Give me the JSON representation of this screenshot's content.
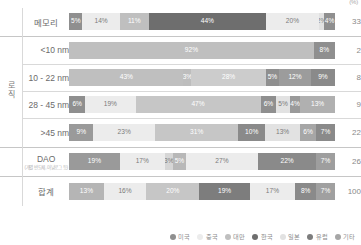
{
  "unit_label": "(%)",
  "legend": {
    "position": "bottom-right",
    "entries": [
      {
        "label": "미국",
        "color": "#8f8f8f"
      },
      {
        "label": "중국",
        "color": "#ececec"
      },
      {
        "label": "대만",
        "color": "#bfbfbf"
      },
      {
        "label": "한국",
        "color": "#6e6e6e"
      },
      {
        "label": "일본",
        "color": "#e2e2e2"
      },
      {
        "label": "유럽",
        "color": "#7d7d7d"
      },
      {
        "label": "기타",
        "color": "#a6a6a6"
      }
    ]
  },
  "groups": [
    {
      "name": "memory",
      "label": "",
      "rows": [
        "memory"
      ]
    },
    {
      "name": "logic",
      "label": "로직",
      "rows": [
        "lt10",
        "n10_22",
        "n28_45",
        "gt45"
      ]
    },
    {
      "name": "dao",
      "label": "",
      "rows": [
        "dao"
      ]
    },
    {
      "name": "total",
      "label": "",
      "rows": [
        "sum"
      ]
    }
  ],
  "row_labels": {
    "memory": {
      "main": "메모리",
      "sub": ""
    },
    "lt10": {
      "main": "<10 nm",
      "sub": ""
    },
    "n10_22": {
      "main": "10 - 22 nm",
      "sub": ""
    },
    "n28_45": {
      "main": "28 - 45 nm",
      "sub": ""
    },
    "gt45": {
      "main": ">45 nm",
      "sub": ""
    },
    "dao": {
      "main": "DAO",
      "sub": "(개별 반도체, 아날로그 등)"
    },
    "sum": {
      "main": "합계",
      "sub": ""
    }
  },
  "totals": {
    "memory": "33",
    "lt10": "2",
    "n10_22": "8",
    "n28_45": "9",
    "gt45": "22",
    "dao": "26",
    "sum": "100"
  },
  "chart_data": {
    "type": "bar",
    "orientation": "horizontal",
    "stacked": true,
    "stack_mode": "100%",
    "title": "",
    "xlabel": "",
    "ylabel": "",
    "xlim": [
      0,
      100
    ],
    "grid": false,
    "unit": "(%)",
    "categories": [
      "메모리",
      "<10 nm",
      "10 - 22 nm",
      "28 - 45 nm",
      ">45 nm",
      "DAO",
      "합계"
    ],
    "category_groups": [
      "",
      "로직",
      "로직",
      "로직",
      "로직",
      "",
      ""
    ],
    "series": [
      {
        "name": "미국",
        "color": "#8f8f8f",
        "values": [
          5,
          0,
          0,
          6,
          9,
          19,
          13
        ]
      },
      {
        "name": "중국",
        "color": "#ececec",
        "values": [
          14,
          0,
          0,
          19,
          23,
          17,
          16
        ]
      },
      {
        "name": "대만",
        "color": "#bfbfbf",
        "values": [
          11,
          92,
          43,
          0,
          0,
          3,
          20
        ]
      },
      {
        "name": "한국",
        "color": "#6e6e6e",
        "values": [
          44,
          0,
          3,
          47,
          31,
          5,
          19
        ]
      },
      {
        "name": "일본",
        "color": "#e2e2e2",
        "values": [
          20,
          0,
          28,
          6,
          10,
          27,
          17
        ]
      },
      {
        "name": "유럽",
        "color": "#7d7d7d",
        "values": [
          2,
          0,
          5,
          5,
          13,
          22,
          8
        ]
      },
      {
        "name": "기타",
        "color": "#a6a6a6",
        "values": [
          4,
          8,
          12,
          4,
          6,
          7,
          7
        ]
      },
      {
        "name": "기타2",
        "color": "#8f8f8f",
        "values": [
          0,
          0,
          9,
          13,
          7,
          0,
          0
        ]
      }
    ],
    "row_totals": [
      33,
      2,
      8,
      9,
      22,
      26,
      100
    ],
    "rows": [
      {
        "key": "memory",
        "label": "메모리",
        "total": 33,
        "segments": [
          {
            "name": "미국",
            "value": 5,
            "label": "5%",
            "color": "#8f8f8f",
            "text": "light"
          },
          {
            "name": "중국",
            "value": 14,
            "label": "14%",
            "color": "#ececec",
            "text": "dark"
          },
          {
            "name": "대만",
            "value": 11,
            "label": "11%",
            "color": "#bfbfbf",
            "text": "light"
          },
          {
            "name": "한국",
            "value": 44,
            "label": "44%",
            "color": "#6e6e6e",
            "text": "light"
          },
          {
            "name": "일본",
            "value": 20,
            "label": "20%",
            "color": "#ececec",
            "text": "dark"
          },
          {
            "name": "유럽",
            "value": 2,
            "label": "2%",
            "color": "#e2e2e2",
            "text": "dark"
          },
          {
            "name": "기타",
            "value": 4,
            "label": "4%",
            "color": "#8f8f8f",
            "text": "light"
          }
        ]
      },
      {
        "key": "lt10",
        "label": "<10 nm",
        "total": 2,
        "segments": [
          {
            "name": "대만",
            "value": 92,
            "label": "92%",
            "color": "#bfbfbf",
            "text": "light"
          },
          {
            "name": "기타",
            "value": 8,
            "label": "8%",
            "color": "#8f8f8f",
            "text": "light"
          }
        ]
      },
      {
        "key": "n10_22",
        "label": "10 - 22 nm",
        "total": 8,
        "segments": [
          {
            "name": "대만",
            "value": 43,
            "label": "43%",
            "color": "#bfbfbf",
            "text": "light"
          },
          {
            "name": "한국",
            "value": 3,
            "label": "3%",
            "color": "#bdbdbd",
            "text": "light"
          },
          {
            "name": "일본",
            "value": 28,
            "label": "28%",
            "color": "#cccccc",
            "text": "light"
          },
          {
            "name": "유럽",
            "value": 5,
            "label": "5%",
            "color": "#8f8f8f",
            "text": "light"
          },
          {
            "name": "기타",
            "value": 12,
            "label": "12%",
            "color": "#9c9c9c",
            "text": "light"
          },
          {
            "name": "기타2",
            "value": 9,
            "label": "9%",
            "color": "#8a8a8a",
            "text": "light"
          }
        ]
      },
      {
        "key": "n28_45",
        "label": "28 - 45 nm",
        "total": 9,
        "segments": [
          {
            "name": "미국",
            "value": 6,
            "label": "6%",
            "color": "#8f8f8f",
            "text": "light"
          },
          {
            "name": "중국",
            "value": 19,
            "label": "19%",
            "color": "#ececec",
            "text": "dark"
          },
          {
            "name": "대만",
            "value": 47,
            "label": "47%",
            "color": "#c6c6c6",
            "text": "light"
          },
          {
            "name": "한국",
            "value": 6,
            "label": "6%",
            "color": "#8f8f8f",
            "text": "light"
          },
          {
            "name": "일본",
            "value": 5,
            "label": "5%",
            "color": "#e2e2e2",
            "text": "dark"
          },
          {
            "name": "유럽",
            "value": 4,
            "label": "4%",
            "color": "#9a9a9a",
            "text": "light"
          },
          {
            "name": "기타",
            "value": 13,
            "label": "13%",
            "color": "#b0b0b0",
            "text": "light"
          }
        ]
      },
      {
        "key": "gt45",
        "label": ">45 nm",
        "total": 22,
        "segments": [
          {
            "name": "미국",
            "value": 9,
            "label": "9%",
            "color": "#9a9a9a",
            "text": "light"
          },
          {
            "name": "중국",
            "value": 23,
            "label": "23%",
            "color": "#ececec",
            "text": "dark"
          },
          {
            "name": "대만",
            "value": 31,
            "label": "31%",
            "color": "#c6c6c6",
            "text": "light"
          },
          {
            "name": "한국",
            "value": 10,
            "label": "10%",
            "color": "#8a8a8a",
            "text": "light"
          },
          {
            "name": "일본",
            "value": 13,
            "label": "13%",
            "color": "#e2e2e2",
            "text": "dark"
          },
          {
            "name": "유럽",
            "value": 6,
            "label": "6%",
            "color": "#a6a6a6",
            "text": "light"
          },
          {
            "name": "기타",
            "value": 7,
            "label": "7%",
            "color": "#8a8a8a",
            "text": "light"
          }
        ]
      },
      {
        "key": "dao",
        "label": "DAO",
        "total": 26,
        "segments": [
          {
            "name": "미국",
            "value": 19,
            "label": "19%",
            "color": "#9a9a9a",
            "text": "light"
          },
          {
            "name": "중국",
            "value": 17,
            "label": "17%",
            "color": "#ececec",
            "text": "dark"
          },
          {
            "name": "대만",
            "value": 3,
            "label": "3%",
            "color": "#d6d6d6",
            "text": "dark"
          },
          {
            "name": "한국",
            "value": 5,
            "label": "5%",
            "color": "#b8b8b8",
            "text": "light"
          },
          {
            "name": "일본",
            "value": 27,
            "label": "27%",
            "color": "#ececec",
            "text": "dark"
          },
          {
            "name": "유럽",
            "value": 22,
            "label": "22%",
            "color": "#8a8a8a",
            "text": "light"
          },
          {
            "name": "기타",
            "value": 7,
            "label": "7%",
            "color": "#9e9e9e",
            "text": "light"
          }
        ]
      },
      {
        "key": "sum",
        "label": "합계",
        "total": 100,
        "segments": [
          {
            "name": "미국",
            "value": 13,
            "label": "13%",
            "color": "#b5b5b5",
            "text": "light"
          },
          {
            "name": "중국",
            "value": 16,
            "label": "16%",
            "color": "#ececec",
            "text": "dark"
          },
          {
            "name": "대만",
            "value": 20,
            "label": "20%",
            "color": "#c6c6c6",
            "text": "light"
          },
          {
            "name": "한국",
            "value": 19,
            "label": "19%",
            "color": "#7d7d7d",
            "text": "light"
          },
          {
            "name": "일본",
            "value": 17,
            "label": "17%",
            "color": "#ececec",
            "text": "dark"
          },
          {
            "name": "유럽",
            "value": 8,
            "label": "8%",
            "color": "#8a8a8a",
            "text": "light"
          },
          {
            "name": "기타",
            "value": 7,
            "label": "7%",
            "color": "#a0a0a0",
            "text": "light"
          }
        ]
      }
    ]
  }
}
